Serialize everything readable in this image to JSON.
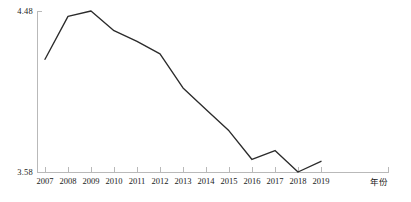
{
  "chart_data": {
    "type": "line",
    "title": "",
    "xlabel": "年份",
    "ylabel": "",
    "categories": [
      "2007",
      "2008",
      "2009",
      "2010",
      "2011",
      "2012",
      "2013",
      "2014",
      "2015",
      "2016",
      "2017",
      "2018",
      "2019"
    ],
    "values": [
      4.21,
      4.45,
      4.48,
      4.37,
      4.31,
      4.24,
      4.05,
      3.93,
      3.81,
      3.65,
      3.7,
      3.58,
      3.64
    ],
    "series": [
      {
        "name": "",
        "values": [
          4.21,
          4.45,
          4.48,
          4.37,
          4.31,
          4.24,
          4.05,
          3.93,
          3.81,
          3.65,
          3.7,
          3.58,
          3.64
        ]
      }
    ],
    "ylim": [
      3.58,
      4.48
    ],
    "ytick_labels": [
      "3.58",
      "4.48"
    ],
    "ytick_values": [
      3.58,
      4.48
    ],
    "xtick_labels": [
      "2007",
      "2008",
      "2009",
      "2010",
      "2011",
      "2012",
      "2013",
      "2014",
      "2015",
      "2016",
      "2017",
      "2018",
      "2019"
    ],
    "grid": false,
    "legend": false,
    "legend_position": "none",
    "annotations": [],
    "line_color": "#2b2b2b",
    "axis_color": "#b9b9b9"
  },
  "axis": {
    "y_top_label": "4.48",
    "y_bottom_label": "3.58",
    "x_axis_title": "年份"
  }
}
